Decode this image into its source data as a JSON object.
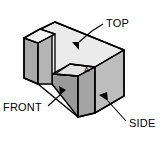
{
  "figure": {
    "kind": "isometric-technical-drawing",
    "background_color": "#ffffff",
    "outline_color": "#000000"
  },
  "labels": {
    "top": "TOP",
    "front": "FRONT",
    "side": "SIDE",
    "surface_a": "A"
  },
  "colors": {
    "top_face": "#e9e9e9",
    "front_face": "#a9a9a9",
    "side_face": "#bdbdbd",
    "inner_face": "#9a9a9a",
    "inner_face_dark": "#8f8f8f",
    "notch_floor": "#d6d6d6",
    "outline": "#000000",
    "leader": "#000000",
    "text": "#000000"
  },
  "geometry": {
    "note": "Coordinates are in the 163x151 pixel image space.",
    "top_face": "24,38 55,22 124,50 94,67",
    "left_leg_top": "24,38 40,29 52,34 38,43",
    "front_face_left_leg": "24,38 38,43 38,84 24,78",
    "front_face_web": "38,43 52,34 52,74 38,84",
    "side_face_right_leg": "95,67 118,52 118,105 95,113",
    "front_face_right_leg": "78,76 95,67 95,113 78,117",
    "inner_wall": "52,74 78,76 78,117 52,84"
  },
  "leaders": [
    {
      "name": "top-leader",
      "label": "TOP",
      "from": [
        103,
        24
      ],
      "to": [
        78,
        45
      ],
      "arrow_at": [
        78,
        45
      ]
    },
    {
      "name": "front-leader",
      "label": "FRONT",
      "from": [
        50,
        105
      ],
      "to": [
        67,
        87
      ],
      "arrow_at": [
        67,
        87
      ]
    },
    {
      "name": "side-leader",
      "label": "SIDE",
      "from": [
        124,
        122
      ],
      "to": [
        104,
        98
      ],
      "arrow_at": [
        104,
        98
      ]
    }
  ],
  "label_positions": {
    "top": [
      106,
      27
    ],
    "front": [
      4,
      110
    ],
    "side": [
      128,
      127
    ],
    "surface_a": [
      87,
      71
    ]
  }
}
